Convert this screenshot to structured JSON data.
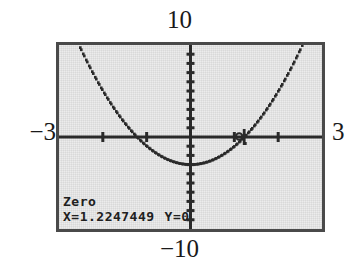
{
  "device": {
    "type": "graphing-calculator-screen",
    "screen_bg": "#ececec",
    "frame_color": "#4a4a4a",
    "trace_color": "#2b2b2b"
  },
  "window": {
    "ymax_label": "10",
    "ymin_label": "−10",
    "xmin_label": "−3",
    "xmax_label": "3"
  },
  "readout": {
    "mode_label": "Zero",
    "x_label": "X=1.2247449",
    "y_label": "Y=0"
  },
  "chart_data": {
    "type": "line",
    "title": "",
    "xlabel": "",
    "ylabel": "",
    "xlim": [
      -3,
      3
    ],
    "ylim": [
      -10,
      10
    ],
    "grid": false,
    "legend": "none",
    "axis_ticks": {
      "x": [
        -3,
        -2,
        -1,
        0,
        1,
        2,
        3
      ],
      "y": [
        -10,
        -9,
        -8,
        -7,
        -6,
        -5,
        -4,
        -3,
        -2,
        -1,
        0,
        1,
        2,
        3,
        4,
        5,
        6,
        7,
        8,
        9,
        10
      ]
    },
    "series": [
      {
        "name": "Y1=2X²-3",
        "style": "dotted-pixel-trace",
        "x": [
          -3,
          -2.8,
          -2.6,
          -2.4,
          -2.2,
          -2,
          -1.8,
          -1.6,
          -1.4,
          -1.2,
          -1,
          -0.8,
          -0.6,
          -0.4,
          -0.2,
          0,
          0.2,
          0.4,
          0.6,
          0.8,
          1,
          1.2,
          1.4,
          1.6,
          1.8,
          2,
          2.2,
          2.4,
          2.6,
          2.8,
          3
        ],
        "y": [
          15,
          12.68,
          10.52,
          8.52,
          6.68,
          5,
          3.48,
          2.12,
          0.92,
          -0.12,
          -1,
          -1.72,
          -2.28,
          -2.68,
          -2.92,
          -3,
          -2.92,
          -2.68,
          -2.28,
          -1.72,
          -1,
          -0.12,
          0.92,
          2.12,
          3.48,
          5,
          6.68,
          8.52,
          10.52,
          12.68,
          15
        ]
      }
    ],
    "annotations": [
      {
        "name": "zero-cursor",
        "x": 1.2247449,
        "y": 0,
        "label": "Zero"
      }
    ]
  }
}
